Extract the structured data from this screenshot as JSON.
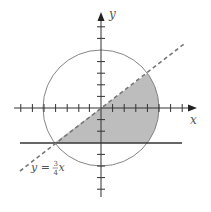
{
  "diagram": {
    "type": "coordinate-plane-region",
    "axes": {
      "x_label": "x",
      "y_label": "y",
      "unit_px": 11.6,
      "origin_px": [
        101,
        108
      ],
      "x_ticks": [
        -8,
        -7,
        -6,
        -5,
        -4,
        -3,
        -2,
        -1,
        1,
        2,
        3,
        4,
        5,
        6,
        7
      ],
      "y_ticks": [
        -7,
        -6,
        -5,
        -4,
        -3,
        -2,
        -1,
        1,
        2,
        3,
        4,
        5,
        6,
        7
      ]
    },
    "circle": {
      "center": [
        0,
        0
      ],
      "radius": 5,
      "stroke": "#777777"
    },
    "dashed_line": {
      "equation": "y = 3/4 x",
      "label_prefix": "y =",
      "label_num": "3",
      "label_den": "4",
      "label_var": "x"
    },
    "horizontal_line": {
      "equation": "y = -3"
    },
    "shaded_region": {
      "description": "Region inside circle, below y = 3/4 x, above y = -3",
      "fill": "#bdbdbd",
      "vertices": [
        [
          -4,
          -3
        ],
        [
          4,
          3
        ],
        [
          4,
          -3
        ]
      ]
    }
  }
}
